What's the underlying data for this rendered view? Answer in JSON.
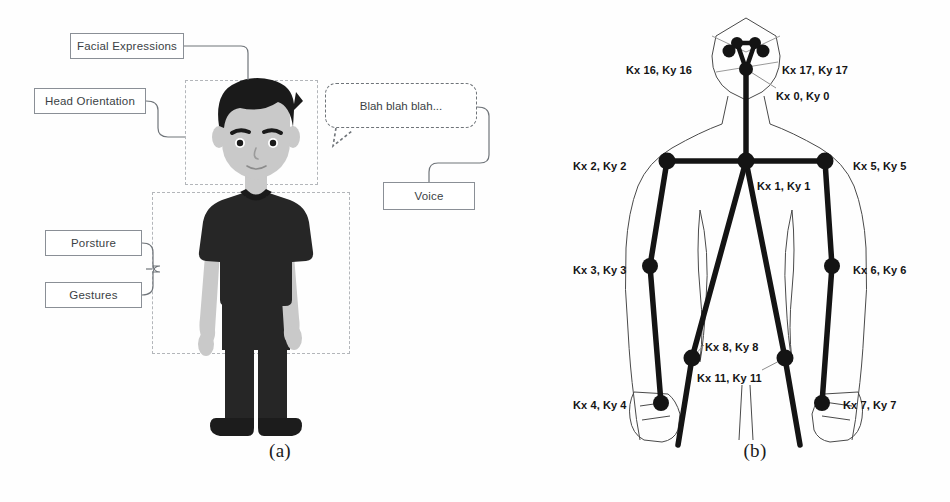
{
  "figure": {
    "panel_a": {
      "caption": "(a)",
      "boxes": [
        {
          "id": "facial",
          "label": "Facial Expressions"
        },
        {
          "id": "head",
          "label": "Head Orientation"
        },
        {
          "id": "posture",
          "label": "Porsture"
        },
        {
          "id": "gestures",
          "label": "Gestures"
        },
        {
          "id": "voice",
          "label": "Voice"
        }
      ],
      "speech_bubble": {
        "text": "Blah blah blah..."
      },
      "regions": [
        {
          "id": "head-region",
          "name": "head-roi"
        },
        {
          "id": "body-region",
          "name": "body-roi"
        }
      ]
    },
    "panel_b": {
      "caption": "(b)",
      "keypoint_labels": [
        {
          "index": 16,
          "text": "Kx 16, Ky 16",
          "x": 626,
          "y": 64
        },
        {
          "index": 17,
          "text": "Kx 17, Ky 17",
          "x": 782,
          "y": 64
        },
        {
          "index": 0,
          "text": "Kx 0, Ky 0",
          "x": 776,
          "y": 90
        },
        {
          "index": 2,
          "text": "Kx 2, Ky 2",
          "x": 573,
          "y": 160
        },
        {
          "index": 5,
          "text": "Kx 5, Ky 5",
          "x": 853,
          "y": 160
        },
        {
          "index": 1,
          "text": "Kx 1, Ky 1",
          "x": 757,
          "y": 180
        },
        {
          "index": 3,
          "text": "Kx 3, Ky 3",
          "x": 573,
          "y": 264
        },
        {
          "index": 6,
          "text": "Kx 6, Ky 6",
          "x": 853,
          "y": 264
        },
        {
          "index": 8,
          "text": "Kx 8, Ky 8",
          "x": 705,
          "y": 341
        },
        {
          "index": 11,
          "text": "Kx 11, Ky 11",
          "x": 697,
          "y": 372
        },
        {
          "index": 4,
          "text": "Kx 4, Ky 4",
          "x": 573,
          "y": 399
        },
        {
          "index": 7,
          "text": "Kx 7, Ky 7",
          "x": 843,
          "y": 399
        }
      ],
      "keypoints": [
        {
          "index": 16,
          "x": 729,
          "y": 51
        },
        {
          "index": 17,
          "x": 763,
          "y": 51
        },
        {
          "index": 14,
          "x": 737,
          "y": 43
        },
        {
          "index": 15,
          "x": 755,
          "y": 43
        },
        {
          "index": 0,
          "x": 746,
          "y": 69
        },
        {
          "index": 1,
          "x": 746,
          "y": 161
        },
        {
          "index": 2,
          "x": 667,
          "y": 161
        },
        {
          "index": 5,
          "x": 825,
          "y": 161
        },
        {
          "index": 3,
          "x": 650,
          "y": 266
        },
        {
          "index": 6,
          "x": 832,
          "y": 266
        },
        {
          "index": 4,
          "x": 661,
          "y": 403
        },
        {
          "index": 7,
          "x": 822,
          "y": 403
        },
        {
          "index": 8,
          "x": 692,
          "y": 358
        },
        {
          "index": 11,
          "x": 785,
          "y": 358
        }
      ]
    }
  },
  "colors": {
    "background": "#fefefe",
    "box_border": "#8a8f96",
    "box_text": "#3b3f45",
    "dashed_region": "#b3b6ba",
    "skeleton": "#141414",
    "body_outline": "#5a5a5a",
    "shirt": "#262626",
    "skin": "#c9c9c9",
    "hair": "#1a1a1a"
  }
}
